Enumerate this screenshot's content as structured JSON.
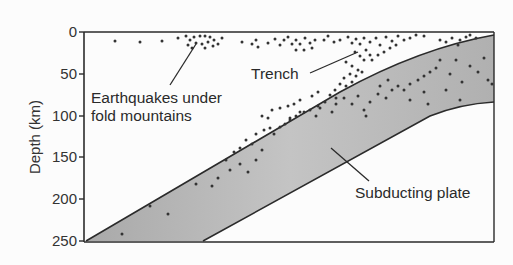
{
  "diagram": {
    "y_axis": {
      "label": "Depth (km)",
      "ticks": [
        "0",
        "50",
        "100",
        "150",
        "200",
        "250"
      ],
      "range": [
        0,
        250
      ]
    },
    "annotations": {
      "earthquakes_line1": "Earthquakes under",
      "earthquakes_line2": "fold mountains",
      "trench": "Trench",
      "subducting_plate": "Subducting plate"
    },
    "colors": {
      "frame": "#2b2b2b",
      "plate_light": "#d9d9d9",
      "plate_dark": "#a9a9a9",
      "dots": "#333333",
      "background": "#fcfcfc"
    }
  },
  "chart_data": {
    "type": "scatter",
    "title": "",
    "xlabel": "",
    "ylabel": "Depth (km)",
    "ylim": [
      250,
      0
    ],
    "y_ticks": [
      0,
      50,
      100,
      150,
      200,
      250
    ],
    "regions": [
      {
        "name": "Subducting plate",
        "shape": "band",
        "top_boundary_depth_left_to_right": [
          250,
          0
        ],
        "bottom_boundary_depth_left_to_right": [
          250,
          80
        ]
      }
    ],
    "annotations": [
      "Earthquakes under fold mountains",
      "Trench",
      "Subducting plate"
    ],
    "clusters": [
      {
        "name": "Earthquakes under fold mountains",
        "depth_range_km": [
          0,
          25
        ]
      },
      {
        "name": "Trench / plate-top earthquakes",
        "depth_range_km": [
          0,
          120
        ]
      },
      {
        "name": "Within subducting plate",
        "depth_range_km": [
          20,
          240
        ]
      }
    ]
  }
}
